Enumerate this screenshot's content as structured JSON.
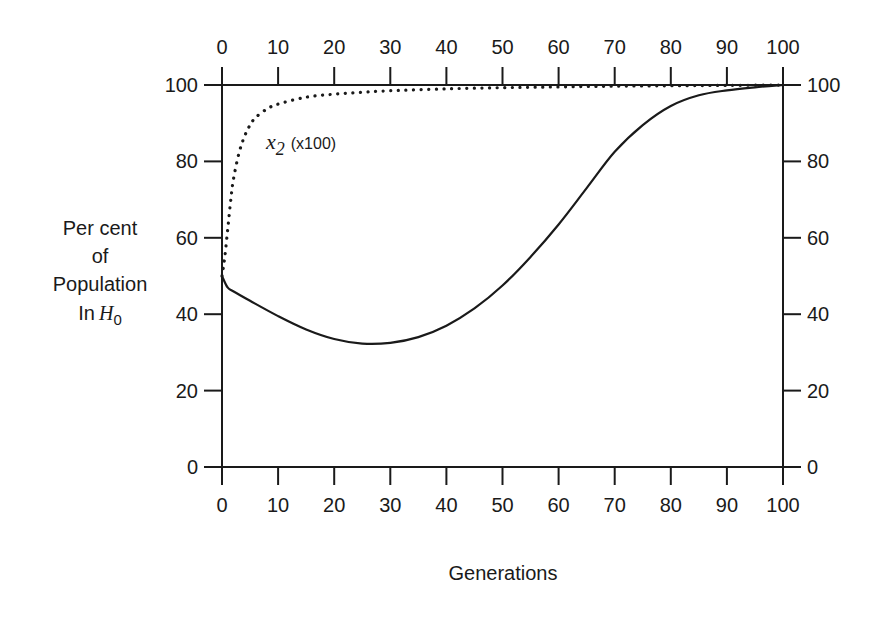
{
  "chart_data": {
    "type": "line",
    "title": "",
    "xlabel": "Generations",
    "ylabel_lines": [
      "Per cent",
      "of",
      "Population",
      "In H0"
    ],
    "ylabel": "Per cent of Population In H0",
    "xlim": [
      0,
      100
    ],
    "ylim": [
      0,
      100
    ],
    "x_ticks": [
      0,
      10,
      20,
      30,
      40,
      50,
      60,
      70,
      80,
      90,
      100
    ],
    "y_ticks": [
      0,
      20,
      40,
      60,
      80,
      100
    ],
    "top_axis_ticks": [
      0,
      10,
      20,
      30,
      40,
      50,
      60,
      70,
      80,
      90,
      100
    ],
    "right_axis_ticks": [
      0,
      20,
      40,
      60,
      80,
      100
    ],
    "grid": false,
    "legend": "none",
    "annotations": [
      {
        "text": "x2 (x100)",
        "x": 8,
        "y": 86,
        "target_series": "x2 (x100)"
      }
    ],
    "series": [
      {
        "name": "Per cent of population in H0",
        "style": "solid",
        "x": [
          0,
          1,
          2,
          5,
          10,
          15,
          20,
          25,
          30,
          35,
          40,
          45,
          50,
          55,
          60,
          65,
          70,
          75,
          80,
          85,
          90,
          95,
          100
        ],
        "values": [
          50,
          47,
          46,
          43.5,
          39.5,
          36,
          33.5,
          32.3,
          32.5,
          34,
          37,
          41.5,
          47.5,
          55,
          63.5,
          73,
          82.5,
          89.5,
          94.5,
          97.3,
          98.6,
          99.4,
          100
        ]
      },
      {
        "name": "x2 (x100)",
        "style": "dotted",
        "x": [
          0,
          0.5,
          1,
          1.5,
          2,
          3,
          4,
          5,
          6,
          8,
          10,
          15,
          20,
          25,
          30,
          40,
          50,
          60,
          70,
          80,
          90,
          100
        ],
        "values": [
          50,
          55,
          62,
          69,
          75,
          82,
          86.5,
          89.5,
          91.5,
          93.7,
          95,
          96.8,
          97.6,
          98.1,
          98.5,
          99,
          99.3,
          99.5,
          99.7,
          99.8,
          99.9,
          100
        ]
      }
    ]
  },
  "labels": {
    "x_axis_title": "Generations",
    "y_axis_title_line1": "Per cent",
    "y_axis_title_line2": "of",
    "y_axis_title_line3": "Population",
    "y_axis_title_line4_prefix": "In",
    "y_axis_title_line4_var": "H",
    "y_axis_title_line4_sub": "0",
    "annotation_var": "x",
    "annotation_sub": "2",
    "annotation_suffix": "(x100)"
  },
  "colors": {
    "line": "#1a1a1a",
    "background": "#ffffff"
  }
}
